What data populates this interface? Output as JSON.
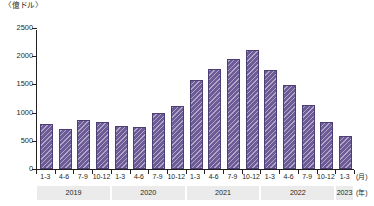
{
  "chart_data": {
    "type": "bar",
    "title": "",
    "unit_label": "〈億ドル〉",
    "xlabel_unit_month": "(月)",
    "xlabel_unit_year": "(年)",
    "ylabel": "",
    "ylim": [
      0,
      2500
    ],
    "ytick_step": 500,
    "yticks": [
      "0",
      "500",
      "1000",
      "1500",
      "2000",
      "2500"
    ],
    "grid": false,
    "legend": null,
    "bar_color": "#6d5b97",
    "bar_border_color": "#4d3f73",
    "bar_pattern": "diagonal-hatch",
    "year_band_color": "#ebebeb",
    "categories": [
      "1-3",
      "4-6",
      "7-9",
      "10-12",
      "1-3",
      "4-6",
      "7-9",
      "10-12",
      "1-3",
      "4-6",
      "7-9",
      "10-12",
      "1-3",
      "4-6",
      "7-9",
      "10-12",
      "1-3"
    ],
    "values": [
      790,
      710,
      870,
      830,
      760,
      750,
      1000,
      1120,
      1580,
      1780,
      1950,
      2110,
      1760,
      1490,
      1140,
      840,
      580
    ],
    "year_groups": [
      {
        "label": "2019",
        "count": 4
      },
      {
        "label": "2020",
        "count": 4
      },
      {
        "label": "2021",
        "count": 4
      },
      {
        "label": "2022",
        "count": 4
      },
      {
        "label": "2023",
        "count": 1
      }
    ]
  }
}
